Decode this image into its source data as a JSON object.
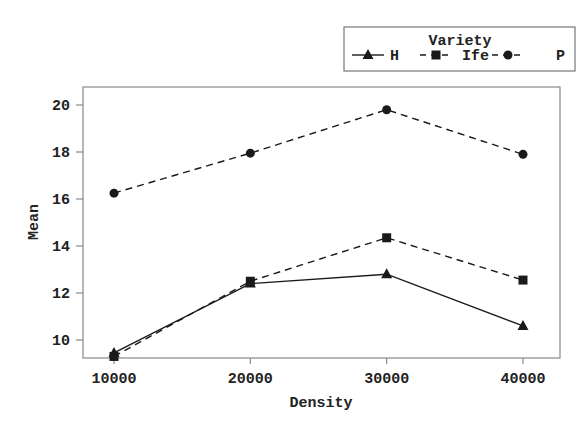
{
  "chart_data": {
    "type": "line",
    "title": "",
    "xlabel": "Density",
    "ylabel": "Mean",
    "categories": [
      "10000",
      "20000",
      "30000",
      "40000"
    ],
    "x": [
      10000,
      20000,
      30000,
      40000
    ],
    "series": [
      {
        "name": "H",
        "marker": "triangle",
        "linestyle": "solid",
        "values": [
          9.45,
          12.4,
          12.8,
          10.6
        ]
      },
      {
        "name": "Ife",
        "marker": "square",
        "linestyle": "dashed",
        "values": [
          9.3,
          12.5,
          14.35,
          12.55
        ]
      },
      {
        "name": "P",
        "marker": "circle",
        "linestyle": "dashed",
        "values": [
          16.25,
          17.95,
          19.8,
          17.9
        ]
      }
    ],
    "yticks": [
      10,
      12,
      14,
      16,
      18,
      20
    ],
    "xticks": [
      10000,
      20000,
      30000,
      40000
    ],
    "ylim": [
      9.23,
      20.77
    ],
    "xlim": [
      8770,
      42900
    ],
    "grid": false,
    "legend": {
      "title": "Variety",
      "position": "top-right-outside",
      "orientation": "horizontal",
      "entries": [
        "H",
        "Ife",
        "P"
      ]
    }
  },
  "colors": {
    "line": "#1a1a1a",
    "frame": "#888888",
    "background": "#ffffff"
  }
}
